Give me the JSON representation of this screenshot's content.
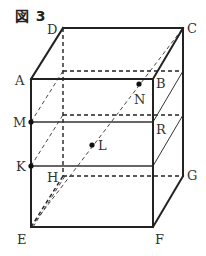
{
  "figure": {
    "title": "図 3",
    "vertices": {
      "A": {
        "label": "A",
        "x": 31,
        "y": 79
      },
      "B": {
        "label": "B",
        "x": 153,
        "y": 79
      },
      "C": {
        "label": "C",
        "x": 183,
        "y": 28
      },
      "D": {
        "label": "D",
        "x": 63,
        "y": 28
      },
      "E": {
        "label": "E",
        "x": 31,
        "y": 227
      },
      "F": {
        "label": "F",
        "x": 153,
        "y": 227
      },
      "G": {
        "label": "G",
        "x": 183,
        "y": 176
      },
      "H": {
        "label": "H",
        "x": 63,
        "y": 176
      }
    },
    "points": {
      "M": {
        "label": "M",
        "x": 31,
        "y": 122
      },
      "K": {
        "label": "K",
        "x": 31,
        "y": 166
      },
      "R": {
        "label": "R",
        "x": 153,
        "y": 122
      },
      "L": {
        "label": "L",
        "x": 92,
        "y": 145
      },
      "N": {
        "label": "N",
        "x": 139,
        "y": 84
      }
    }
  }
}
